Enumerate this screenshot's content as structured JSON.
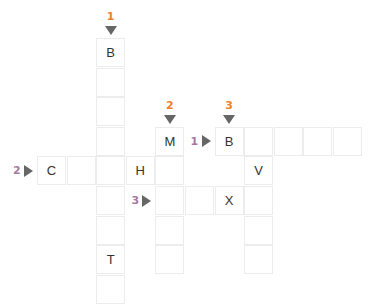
{
  "colors": {
    "down_number": "#f07f2c",
    "across_number": "#a77a9e",
    "arrow": "#666666",
    "cell_border": "#ececec"
  },
  "grid": {
    "cell_size": 29.6,
    "origin_x": 37,
    "origin_y": 38
  },
  "clues": {
    "down": [
      {
        "number": "1",
        "col": 2,
        "row": 0
      },
      {
        "number": "2",
        "col": 4,
        "row": 3
      },
      {
        "number": "3",
        "col": 6,
        "row": 3
      }
    ],
    "across": [
      {
        "number": "1",
        "col": 6,
        "row": 3
      },
      {
        "number": "2",
        "col": 0,
        "row": 4
      },
      {
        "number": "3",
        "col": 4,
        "row": 5
      }
    ]
  },
  "cells": [
    {
      "col": 2,
      "row": 0,
      "letter": "B"
    },
    {
      "col": 2,
      "row": 1,
      "letter": ""
    },
    {
      "col": 2,
      "row": 2,
      "letter": ""
    },
    {
      "col": 2,
      "row": 3,
      "letter": ""
    },
    {
      "col": 2,
      "row": 4,
      "letter": ""
    },
    {
      "col": 2,
      "row": 5,
      "letter": ""
    },
    {
      "col": 2,
      "row": 6,
      "letter": ""
    },
    {
      "col": 2,
      "row": 7,
      "letter": "T"
    },
    {
      "col": 2,
      "row": 8,
      "letter": ""
    },
    {
      "col": 4,
      "row": 3,
      "letter": "M"
    },
    {
      "col": 4,
      "row": 4,
      "letter": ""
    },
    {
      "col": 4,
      "row": 5,
      "letter": ""
    },
    {
      "col": 4,
      "row": 6,
      "letter": ""
    },
    {
      "col": 4,
      "row": 7,
      "letter": ""
    },
    {
      "col": 6,
      "row": 3,
      "letter": "B"
    },
    {
      "col": 7,
      "row": 3,
      "letter": ""
    },
    {
      "col": 8,
      "row": 3,
      "letter": ""
    },
    {
      "col": 9,
      "row": 3,
      "letter": ""
    },
    {
      "col": 10,
      "row": 3,
      "letter": ""
    },
    {
      "col": 0,
      "row": 4,
      "letter": "C"
    },
    {
      "col": 1,
      "row": 4,
      "letter": ""
    },
    {
      "col": 3,
      "row": 4,
      "letter": "H"
    },
    {
      "col": 7,
      "row": 4,
      "letter": "V"
    },
    {
      "col": 5,
      "row": 5,
      "letter": ""
    },
    {
      "col": 6,
      "row": 5,
      "letter": "X"
    },
    {
      "col": 7,
      "row": 5,
      "letter": ""
    },
    {
      "col": 7,
      "row": 6,
      "letter": ""
    },
    {
      "col": 7,
      "row": 7,
      "letter": ""
    }
  ]
}
